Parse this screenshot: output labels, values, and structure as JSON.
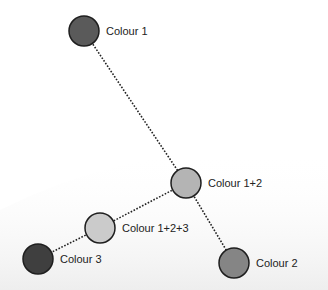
{
  "diagram": {
    "type": "colour-mixing-tree",
    "nodes": [
      {
        "id": "c1",
        "label": "Colour 1",
        "x": 84,
        "y": 31,
        "r": 15,
        "fill": "#5a5a5a"
      },
      {
        "id": "c12",
        "label": "Colour 1+2",
        "x": 186,
        "y": 183,
        "r": 15,
        "fill": "#b4b4b4"
      },
      {
        "id": "c123",
        "label": "Colour 1+2+3",
        "x": 100,
        "y": 228,
        "r": 15,
        "fill": "#cbcbcb"
      },
      {
        "id": "c3",
        "label": "Colour 3",
        "x": 38,
        "y": 259,
        "r": 15,
        "fill": "#3f3f3f"
      },
      {
        "id": "c2",
        "label": "Colour 2",
        "x": 234,
        "y": 263,
        "r": 15,
        "fill": "#858585"
      }
    ],
    "edges": [
      {
        "from": "c1",
        "to": "c12"
      },
      {
        "from": "c12",
        "to": "c2"
      },
      {
        "from": "c12",
        "to": "c123"
      },
      {
        "from": "c123",
        "to": "c3"
      }
    ],
    "style": {
      "edge_color": "#222222",
      "node_stroke": "#1e1e1e",
      "background": "#ffffff",
      "background_shade": "#f0f0f0"
    }
  }
}
